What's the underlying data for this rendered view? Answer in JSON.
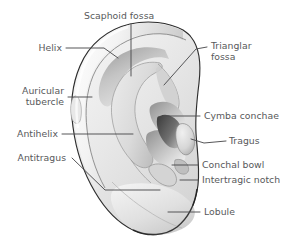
{
  "figure": {
    "background_color": "#ffffff",
    "label_color": "#58595b",
    "leader_line_color": "#4d4d4f",
    "outline_color": "#231f20",
    "skin_light": "#f1f1f1",
    "skin_mid": "#dcdcdc",
    "skin_dark": "#a8a8a8",
    "shadow_dark": "#555555"
  },
  "labels": [
    {
      "id": "scaphoid-fossa",
      "text": "Scaphoid fossa",
      "line2": ""
    },
    {
      "id": "helix",
      "text": "Helix",
      "line2": ""
    },
    {
      "id": "trianglar-fossa",
      "text": "Trianglar",
      "line2": "fossa"
    },
    {
      "id": "auricular-tubercle",
      "text": "Auricular",
      "line2": "tubercle"
    },
    {
      "id": "cymba-conchae",
      "text": "Cymba conchae",
      "line2": ""
    },
    {
      "id": "antihelix",
      "text": "Antihelix",
      "line2": ""
    },
    {
      "id": "tragus",
      "text": "Tragus",
      "line2": ""
    },
    {
      "id": "antitragus",
      "text": "Antitragus",
      "line2": ""
    },
    {
      "id": "conchal-bowl",
      "text": "Conchal bowl",
      "line2": ""
    },
    {
      "id": "intertragic-notch",
      "text": "Intertragic notch",
      "line2": ""
    },
    {
      "id": "lobule",
      "text": "Lobule",
      "line2": ""
    }
  ]
}
